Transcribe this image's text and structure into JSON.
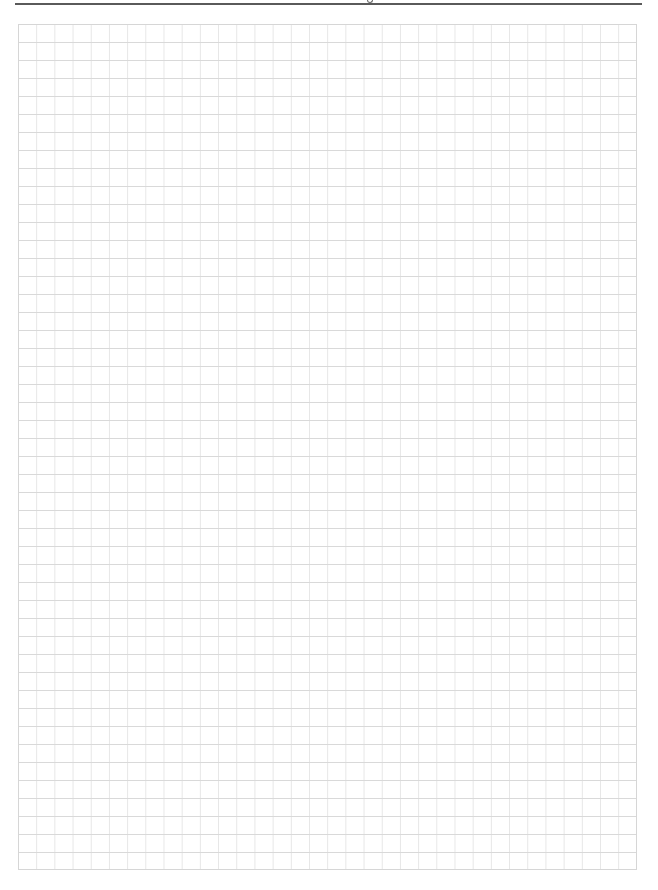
{
  "page": {
    "type": "graph-paper",
    "header": {
      "text": "",
      "rule_color": "#5a5a5a"
    },
    "grid": {
      "columns": 34,
      "rows": 47,
      "cell_width_px": 18.2,
      "cell_height_px": 18,
      "horizontal_line_color": "#d9d9d9",
      "vertical_line_color": "#e6e6e6",
      "border_color": "#d6d6d6"
    }
  }
}
